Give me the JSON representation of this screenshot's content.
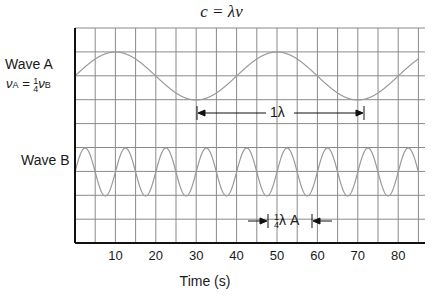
{
  "title_equation": "c = λν",
  "wave_a": {
    "label": "Wave A",
    "relation_lhs": "ν",
    "relation_lhs_sub": "A",
    "relation_eq": " = ",
    "relation_frac_num": "1",
    "relation_frac_den": "4",
    "relation_rhs": "ν",
    "relation_rhs_sub": "B"
  },
  "wave_b": {
    "label": "Wave B"
  },
  "annotations": {
    "one_lambda": "1λ",
    "quarter_lambda_num": "1",
    "quarter_lambda_den": "4",
    "quarter_lambda_rest": "λ A"
  },
  "axis": {
    "xlabel": "Time (s)",
    "ticks": [
      "10",
      "20",
      "30",
      "40",
      "50",
      "60",
      "70",
      "80"
    ]
  },
  "colors": {
    "grid": "#8a8a8a",
    "wave": "#9a9a9a",
    "axis": "#111111"
  },
  "chart_data": {
    "type": "line",
    "title": "c = λν",
    "xlabel": "Time (s)",
    "ylabel": "",
    "xlim": [
      0,
      85
    ],
    "grid": true,
    "series": [
      {
        "name": "Wave A",
        "period_s": 40,
        "peaks_at": [
          10,
          50
        ],
        "troughs_at": [
          30,
          70
        ],
        "relation": "νA = 1/4 νB"
      },
      {
        "name": "Wave B",
        "period_s": 10,
        "peaks_at": [
          2.5,
          12.5,
          22.5,
          32.5,
          42.5,
          52.5,
          62.5,
          72.5
        ]
      }
    ],
    "annotations": [
      {
        "text": "1λ",
        "from_t": 30,
        "to_t": 70,
        "series": "Wave A"
      },
      {
        "text": "1/4 λ A",
        "from_t": 47.5,
        "to_t": 57.5,
        "series": "Wave B"
      }
    ]
  }
}
